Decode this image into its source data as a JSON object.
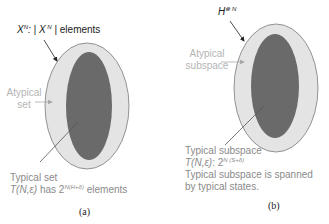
{
  "panel_a": {
    "top_label": {
      "prefix": "X",
      "prefix_sup": "N",
      "sep": ": | X",
      "sep_sup": " N",
      "suffix": "| elements"
    },
    "atypical_label": {
      "line1": "Atypical",
      "line2": "set"
    },
    "typical_label": {
      "line1": "Typical set",
      "line2_prefix": "T(N,ε)",
      "line2_mid": " has 2",
      "line2_sup": "N(H+δ)",
      "line2_suffix": " elements"
    },
    "caption": "(a)"
  },
  "panel_b": {
    "top_label": {
      "prefix": "H",
      "prefix_sup": "⊗ N"
    },
    "atypical_label": {
      "line1": "Atypical",
      "line2": "subspace"
    },
    "typical_label": {
      "line1": "Typical subspace",
      "line2_prefix": "T(N,ε)",
      "line2_mid": ": 2",
      "line2_sup": "N (S+δ)",
      "line3": "Typical subspace is spanned",
      "line4": "by typical states."
    },
    "caption": "(b)"
  },
  "colors": {
    "outer_fill": "#e4e4e4",
    "outer_stroke": "#7a7a7a",
    "inner_fill": "#6a6a6a",
    "arrow_dark": "#222222",
    "arrow_light": "#a8a8a8"
  }
}
